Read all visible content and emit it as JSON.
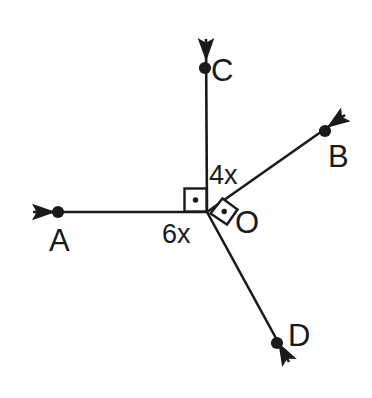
{
  "figure": {
    "background_color": "#ffffff",
    "stroke_color": "#1a1a1a",
    "width": 372,
    "height": 398
  },
  "vertex": {
    "name": "O",
    "label": "O",
    "x": 207,
    "y": 212,
    "label_x": 235,
    "label_y": 207
  },
  "rays": [
    {
      "name": "ray-OA",
      "label": "A",
      "direction": "left",
      "from_x": 207,
      "from_y": 212,
      "to_x": 31,
      "to_y": 212,
      "point_x": 58,
      "point_y": 212,
      "label_x": 49,
      "label_y": 225
    },
    {
      "name": "ray-OC",
      "label": "C",
      "direction": "up",
      "from_x": 207,
      "from_y": 212,
      "to_x": 206,
      "to_y": 37,
      "point_x": 205,
      "point_y": 68,
      "label_x": 211,
      "label_y": 55
    },
    {
      "name": "ray-OB",
      "label": "B",
      "direction": "up-right",
      "from_x": 207,
      "from_y": 212,
      "to_x": 347,
      "to_y": 114,
      "point_x": 325,
      "point_y": 131,
      "label_x": 328,
      "label_y": 141
    },
    {
      "name": "ray-OD",
      "label": "D",
      "direction": "down-right",
      "from_x": 207,
      "from_y": 212,
      "to_x": 291,
      "to_y": 365,
      "point_x": 277,
      "point_y": 343,
      "label_x": 288,
      "label_y": 320
    }
  ],
  "angle_labels": [
    {
      "name": "angle-label-4x",
      "text": "4x",
      "between_rays": "OC and OB",
      "x": 209,
      "y": 162
    },
    {
      "name": "angle-label-6x",
      "text": "6x",
      "between_rays": "OA and OD",
      "x": 162,
      "y": 221
    }
  ],
  "right_angle_markers": [
    {
      "name": "right-angle-marker-AOC",
      "between_rays": "OA and OC",
      "style": "square-with-center-dot",
      "orientation": "axis-aligned"
    },
    {
      "name": "right-angle-marker-BOD",
      "between_rays": "OB and OD",
      "style": "square-with-center-dot",
      "orientation": "rotated"
    }
  ]
}
